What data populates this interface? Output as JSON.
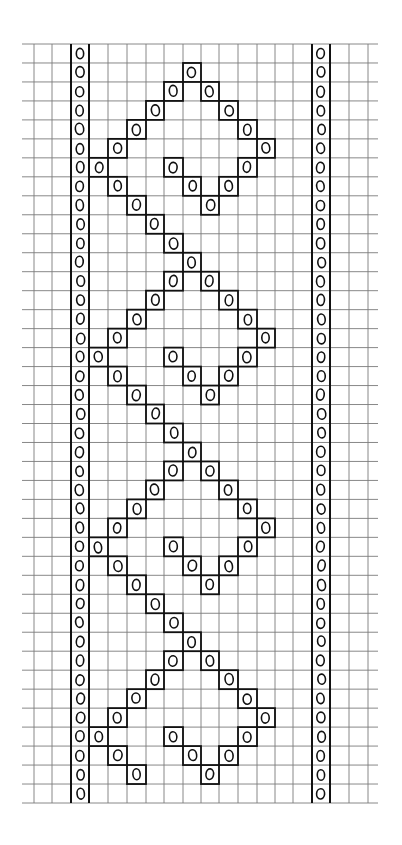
{
  "chart_title": "",
  "grid": {
    "col_edges": [
      22,
      34,
      52,
      71,
      89,
      108,
      127,
      146,
      164,
      183,
      201,
      219,
      238,
      257,
      275,
      293,
      312,
      330,
      349,
      368,
      380
    ],
    "row_top": 44,
    "row_bottom": 803,
    "row_count": 40,
    "col_count": 20,
    "gridline_color": "#7a7a7a",
    "ink_color": "#111111",
    "paper_color": "#ffffff"
  },
  "symbol": {
    "name": "yarn-over",
    "glyph": "O"
  },
  "border_columns": {
    "left": 3,
    "right": 16,
    "description": "Every row has an O stitch in the left and right border columns"
  },
  "pattern_rows": [
    {
      "row": 0,
      "cols": []
    },
    {
      "row": 1,
      "cols": [
        9
      ]
    },
    {
      "row": 2,
      "cols": [
        8,
        10
      ]
    },
    {
      "row": 3,
      "cols": [
        7,
        11
      ]
    },
    {
      "row": 4,
      "cols": [
        6,
        12
      ]
    },
    {
      "row": 5,
      "cols": [
        5,
        13
      ]
    },
    {
      "row": 6,
      "cols": [
        4,
        8,
        12
      ]
    },
    {
      "row": 7,
      "cols": [
        5,
        9,
        11
      ]
    },
    {
      "row": 8,
      "cols": [
        6,
        10
      ]
    },
    {
      "row": 9,
      "cols": [
        7
      ]
    },
    {
      "row": 10,
      "cols": [
        8
      ]
    },
    {
      "row": 11,
      "cols": [
        9
      ]
    },
    {
      "row": 12,
      "cols": [
        8,
        10
      ]
    },
    {
      "row": 13,
      "cols": [
        7,
        11
      ]
    },
    {
      "row": 14,
      "cols": [
        6,
        12
      ]
    },
    {
      "row": 15,
      "cols": [
        5,
        13
      ]
    },
    {
      "row": 16,
      "cols": [
        4,
        8,
        12
      ]
    },
    {
      "row": 17,
      "cols": [
        5,
        9,
        11
      ]
    },
    {
      "row": 18,
      "cols": [
        6,
        10
      ]
    },
    {
      "row": 19,
      "cols": [
        7
      ]
    },
    {
      "row": 20,
      "cols": [
        8
      ]
    },
    {
      "row": 21,
      "cols": [
        9
      ]
    },
    {
      "row": 22,
      "cols": [
        8,
        10
      ]
    },
    {
      "row": 23,
      "cols": [
        7,
        11
      ]
    },
    {
      "row": 24,
      "cols": [
        6,
        12
      ]
    },
    {
      "row": 25,
      "cols": [
        5,
        13
      ]
    },
    {
      "row": 26,
      "cols": [
        4,
        8,
        12
      ]
    },
    {
      "row": 27,
      "cols": [
        5,
        9,
        11
      ]
    },
    {
      "row": 28,
      "cols": [
        6,
        10
      ]
    },
    {
      "row": 29,
      "cols": [
        7
      ]
    },
    {
      "row": 30,
      "cols": [
        8
      ]
    },
    {
      "row": 31,
      "cols": [
        9
      ]
    },
    {
      "row": 32,
      "cols": [
        8,
        10
      ]
    },
    {
      "row": 33,
      "cols": [
        7,
        11
      ]
    },
    {
      "row": 34,
      "cols": [
        6,
        12
      ]
    },
    {
      "row": 35,
      "cols": [
        5,
        13
      ]
    },
    {
      "row": 36,
      "cols": [
        4,
        8,
        12
      ]
    },
    {
      "row": 37,
      "cols": [
        5,
        9,
        11
      ]
    },
    {
      "row": 38,
      "cols": [
        6,
        10
      ]
    },
    {
      "row": 39,
      "cols": []
    }
  ]
}
